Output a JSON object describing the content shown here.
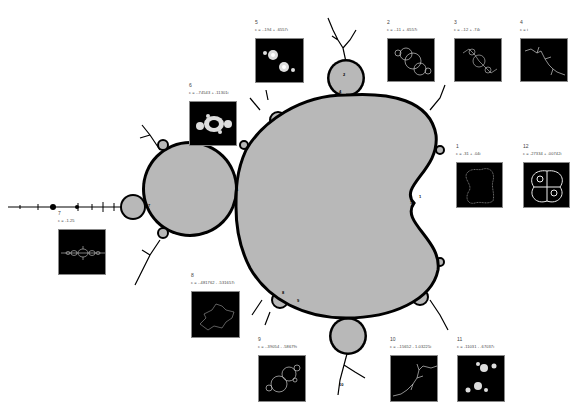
{
  "figure": {
    "title": ""
  },
  "colors": {
    "set_fill": "#b8b8b8",
    "boundary": "#000000",
    "background": "#ffffff",
    "thumb_bg": "#000000",
    "julia_line": "#e8e8e8"
  },
  "thumbnails": [
    {
      "id": "1",
      "label": "1",
      "c": "c = .31 + .04i"
    },
    {
      "id": "2",
      "label": "2",
      "c": "c = -.11 + .6557i"
    },
    {
      "id": "3",
      "label": "3",
      "c": "c = -.12 + .74i"
    },
    {
      "id": "4",
      "label": "4",
      "c": "c = i"
    },
    {
      "id": "5",
      "label": "5",
      "c": "c = -.194 + .6557i"
    },
    {
      "id": "6",
      "label": "6",
      "c": "c = -.74543 + .11301i"
    },
    {
      "id": "7",
      "label": "7",
      "c": "c = -1.25"
    },
    {
      "id": "8",
      "label": "8",
      "c": "c = -.481762 - .531657i"
    },
    {
      "id": "9",
      "label": "9",
      "c": "c = -.39054 - .58679i"
    },
    {
      "id": "10",
      "label": "10",
      "c": "c = -.15652 - 1.03225i"
    },
    {
      "id": "11",
      "label": "11",
      "c": "c = .11031 - .67037i"
    },
    {
      "id": "12",
      "label": "12",
      "c": "c = .27334 + .00742i"
    }
  ],
  "markers": [
    {
      "label": "1",
      "position": "right cusp of main cardioid"
    },
    {
      "label": "2",
      "position": "top bulb"
    },
    {
      "label": "3",
      "position": "top bulb"
    },
    {
      "label": "4",
      "position": "top bulb neck"
    },
    {
      "label": "5",
      "position": "top bulb"
    },
    {
      "label": "6",
      "position": "junction cardioid / period-2 bulb"
    },
    {
      "label": "7",
      "position": "left small bulb"
    },
    {
      "label": "8",
      "position": "lower cardioid edge"
    },
    {
      "label": "9",
      "position": "lower cardioid edge"
    },
    {
      "label": "10",
      "position": "bottom filament"
    },
    {
      "label": "12",
      "position": "right cusp"
    }
  ]
}
